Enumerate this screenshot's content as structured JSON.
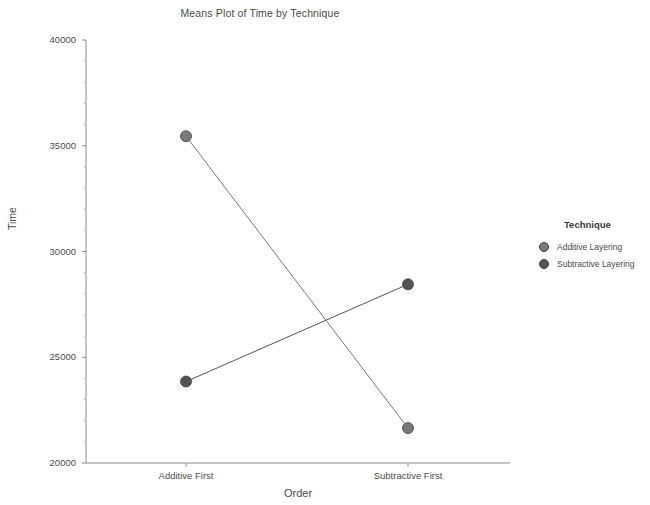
{
  "chart_data": {
    "type": "line",
    "title": "Means Plot of Time by Technique",
    "xlabel": "Order",
    "ylabel": "Time",
    "categories": [
      "Additive First",
      "Subtractive First"
    ],
    "ylim": [
      20000,
      40000
    ],
    "yticks": [
      20000,
      25000,
      30000,
      35000,
      40000
    ],
    "ytick_labels": [
      "20000",
      "25000",
      "30000",
      "35000",
      "40000"
    ],
    "grid": false,
    "legend_position": "right",
    "legend_title": "Technique",
    "series": [
      {
        "name": "Additive Layering",
        "values": [
          35450,
          21650
        ],
        "color": "#7a7a7a",
        "marker": "circle"
      },
      {
        "name": "Subtractive Layering",
        "values": [
          23850,
          28450
        ],
        "color": "#545454",
        "marker": "circle"
      }
    ]
  },
  "axis": {
    "line_color": "#8c8c8c"
  }
}
